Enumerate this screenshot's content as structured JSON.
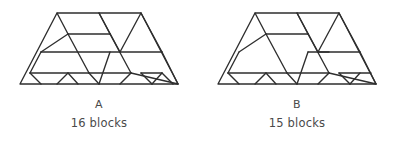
{
  "page": {
    "background_color": "#ffffff",
    "stroke_color": "#2e2e2e",
    "text_color": "#4a4a4a",
    "width": 397,
    "height": 143
  },
  "figures": [
    {
      "id": "figure-a",
      "letter": "A",
      "count_label": "16 blocks",
      "block_count": 16,
      "shape": "trapezoid",
      "outline": "M 20,82 L 57,11 L 141,11 L 178,82 Z",
      "interior_edges": [
        "M 68,32 L 110,32",
        "M 110,32 L 131,71",
        "M 131,71 L 89,71",
        "M 89,71 L 68,32",
        "M 57,11 L 68,32",
        "M 110,32 L 99,11",
        "M 99,11 L 120,50",
        "M 120,50 L 162,50",
        "M 120,50 L 141,11",
        "M 162,50 L 141,11",
        "M 41,50 L 120,50",
        "M 41,50 L 68,32",
        "M 30,71 L 89,71",
        "M 30,71 L 41,50",
        "M 131,71 L 178,82",
        "M 162,50 L 178,82",
        "M 141,71 L 162,71",
        "M 141,71 L 152,82",
        "M 152,82 L 162,71",
        "M 162,71 L 173,82",
        "M 89,71 L 99,82",
        "M 99,82 L 110,50",
        "M 120,82 L 131,71",
        "M 41,82 L 30,71",
        "M 57,82 L 68,71",
        "M 68,71 L 78,82"
      ]
    },
    {
      "id": "figure-b",
      "letter": "B",
      "count_label": "15 blocks",
      "block_count": 15,
      "shape": "trapezoid",
      "outline": "M 20,82 L 57,11 L 141,11 L 178,82 Z",
      "interior_edges": [
        "M 68,32 L 110,32",
        "M 110,32 L 131,71",
        "M 131,71 L 89,71",
        "M 89,71 L 68,32",
        "M 57,11 L 68,32",
        "M 110,32 L 99,11",
        "M 99,11 L 120,50",
        "M 120,50 L 162,50",
        "M 120,50 L 141,11",
        "M 162,50 L 141,11",
        "M 41,50 L 68,32",
        "M 30,71 L 89,71",
        "M 30,71 L 41,50",
        "M 131,71 L 178,82",
        "M 162,50 L 178,82",
        "M 141,71 L 173,71",
        "M 141,71 L 152,82",
        "M 152,82 L 162,71",
        "M 89,71 L 99,82",
        "M 99,82 L 110,50",
        "M 120,82 L 131,71",
        "M 41,82 L 30,71",
        "M 57,82 L 68,71",
        "M 68,71 L 78,82",
        "M 110,50 L 131,50"
      ]
    }
  ]
}
